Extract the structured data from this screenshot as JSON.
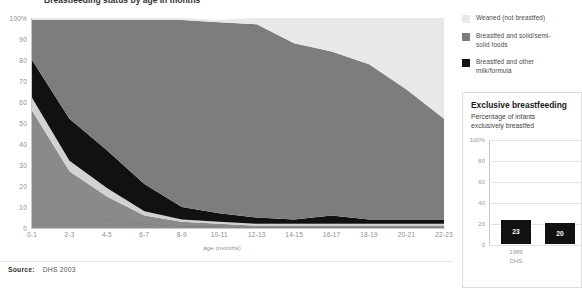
{
  "main": {
    "title": "Breastfeeding status by age in months",
    "source_label": "Source:",
    "source_value": "DHS 2003",
    "xaxis_title": "age (months)"
  },
  "legend": {
    "items": [
      {
        "label": "Weaned (not breastfed)",
        "color": "#e8e8e8",
        "key": "weaned"
      },
      {
        "label": "Breastfed and solid/semi-solid foods",
        "color": "#7d7d7d",
        "key": "solids"
      },
      {
        "label": "Breastfed and other milk/formula",
        "color": "#111111",
        "key": "othermilk"
      }
    ]
  },
  "inset": {
    "title": "Exclusive breastfeeding",
    "subtitle": "Percentage of infants exclusively breastfed",
    "yticks": [
      "100%",
      "80",
      "60",
      "40",
      "20",
      "0"
    ],
    "source_note": "DHS",
    "bars": [
      {
        "label": "1989",
        "sublabel": "DHS",
        "value": 23
      },
      {
        "label": "",
        "sublabel": "",
        "value": 20
      }
    ]
  },
  "chart_data": {
    "type": "area",
    "title": "Breastfeeding status by age in months",
    "xlabel": "age (months)",
    "ylabel": "",
    "ylim": [
      0,
      100
    ],
    "grid": false,
    "legend_position": "right",
    "stacked": true,
    "categories": [
      "0-1",
      "2-3",
      "4-5",
      "6-7",
      "8-9",
      "10-11",
      "12-13",
      "14-15",
      "16-17",
      "18-19",
      "20-21",
      "22-23"
    ],
    "series": [
      {
        "name": "Exclusively breastfed",
        "color": "#8a8a8a",
        "values": [
          24,
          9,
          4,
          2,
          1,
          1,
          0,
          0,
          0,
          0,
          0,
          0
        ]
      },
      {
        "name": "Breastfed and plain water only",
        "color": "#8a8a8a",
        "values": [
          32,
          18,
          11,
          4,
          2,
          1,
          1,
          1,
          1,
          1,
          1,
          1
        ]
      },
      {
        "name": "Breastfed and non-milk liquids",
        "color": "#d2d2d2",
        "values": [
          6,
          5,
          4,
          2,
          1,
          1,
          1,
          1,
          1,
          1,
          1,
          1
        ]
      },
      {
        "name": "Breastfed and other milk/formula",
        "color": "#111111",
        "values": [
          18,
          20,
          18,
          13,
          6,
          4,
          3,
          2,
          4,
          2,
          2,
          2
        ]
      },
      {
        "name": "Breastfed and solid/semi-solid foods",
        "color": "#7d7d7d",
        "values": [
          19,
          47,
          62,
          78,
          89,
          91,
          92,
          84,
          78,
          74,
          62,
          48
        ]
      },
      {
        "name": "Weaned (not breastfed)",
        "color": "#e8e8e8",
        "values": [
          1,
          1,
          1,
          1,
          1,
          1,
          3,
          12,
          16,
          22,
          34,
          48
        ]
      }
    ],
    "yticks": [
      0,
      10,
      20,
      30,
      40,
      50,
      60,
      70,
      80,
      90,
      100
    ],
    "ytick_labels": [
      "0",
      "10",
      "20",
      "30",
      "40",
      "50",
      "60",
      "70",
      "80",
      "90",
      "100%"
    ]
  }
}
